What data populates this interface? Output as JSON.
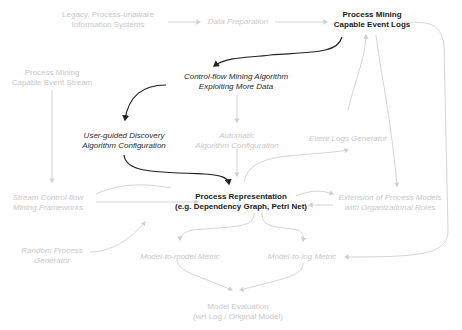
{
  "diagram": {
    "nodes": {
      "legacy": {
        "lines": [
          "Legacy, Process-unaware",
          "Information Systems"
        ],
        "style": "faded"
      },
      "data_prep": {
        "lines": [
          "Data Preparation"
        ],
        "style": "faded-italic"
      },
      "event_logs": {
        "lines": [
          "Process Mining",
          "Capable Event Logs"
        ],
        "style": "dark-bold"
      },
      "event_stream": {
        "lines": [
          "Process Mining",
          "Capable Event Stream"
        ],
        "style": "faded"
      },
      "control_flow": {
        "lines": [
          "Control-flow Mining Algorithm",
          "Exploiting More Data"
        ],
        "style": "dark-italic"
      },
      "user_guided": {
        "lines": [
          "User-guided Discovery",
          "Algorithm Configuration"
        ],
        "style": "dark-italic"
      },
      "automatic": {
        "lines": [
          "Automatic",
          "Algorithm Configuration"
        ],
        "style": "faded-italic"
      },
      "event_gen": {
        "lines": [
          "Event Logs Generator"
        ],
        "style": "faded-italic"
      },
      "stream_cf": {
        "lines": [
          "Stream Control-flow",
          "Mining Frameworks"
        ],
        "style": "faded-italic"
      },
      "process_rep": {
        "lines": [
          "Process Representation",
          "(e.g. Dependency Graph, Petri Net)"
        ],
        "style": "dark-bold"
      },
      "extension": {
        "lines": [
          "Extension of Process Models",
          "with Organizational Roles"
        ],
        "style": "faded-italic"
      },
      "random_gen": {
        "lines": [
          "Random Process",
          "Generator"
        ],
        "style": "faded-italic"
      },
      "m2m": {
        "lines": [
          "Model-to-model Metric"
        ],
        "style": "faded-italic"
      },
      "m2l": {
        "lines": [
          "Model-to-log Metric"
        ],
        "style": "faded-italic"
      },
      "evaluation": {
        "lines": [
          "Model Evaluation",
          "(wrt Log / Original Model)"
        ],
        "style": "faded"
      }
    },
    "colors": {
      "dark": "#1a1a1a",
      "faded": "#c8c8c8",
      "edge_faded": "#cfcfcf",
      "edge_dark": "#222222"
    }
  }
}
